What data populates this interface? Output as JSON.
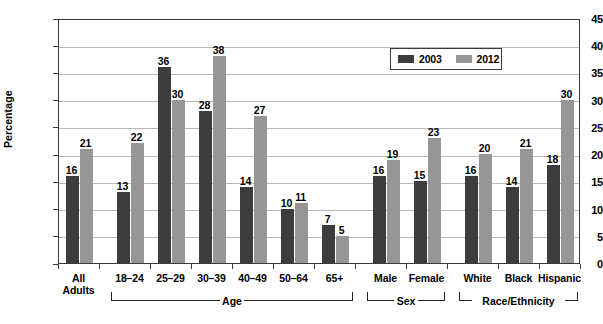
{
  "chart_data": {
    "type": "bar",
    "title": "",
    "xlabel": "",
    "ylabel": "Percentage",
    "ylim": [
      0,
      45
    ],
    "yticks": [
      0,
      5,
      10,
      15,
      20,
      25,
      30,
      35,
      40,
      45
    ],
    "grid": true,
    "legend_position": "top-right",
    "categories": [
      "All Adults",
      "18–24",
      "25–29",
      "30–39",
      "40–49",
      "50–64",
      "65+",
      "Male",
      "Female",
      "White",
      "Black",
      "Hispanic"
    ],
    "series": [
      {
        "name": "2003",
        "color": "#3c3c3c",
        "values": [
          16,
          13,
          36,
          28,
          14,
          10,
          7,
          16,
          15,
          16,
          14,
          18
        ]
      },
      {
        "name": "2012",
        "color": "#969696",
        "values": [
          21,
          22,
          30,
          38,
          27,
          11,
          5,
          19,
          23,
          20,
          21,
          30
        ]
      }
    ],
    "groups": [
      {
        "label": "Age",
        "categories": [
          "18–24",
          "25–29",
          "30–39",
          "40–49",
          "50–64",
          "65+"
        ]
      },
      {
        "label": "Sex",
        "categories": [
          "Male",
          "Female"
        ]
      },
      {
        "label": "Race/Ethnicity",
        "categories": [
          "White",
          "Black",
          "Hispanic"
        ]
      }
    ]
  },
  "axis": {
    "y_title": "Percentage",
    "y_labels": [
      "45",
      "40",
      "35",
      "30",
      "25",
      "20",
      "15",
      "10",
      "5",
      "0"
    ]
  },
  "legend": {
    "entries": [
      {
        "label": "2003",
        "color": "#3c3c3c"
      },
      {
        "label": "2012",
        "color": "#969696"
      }
    ]
  },
  "categories": [
    {
      "line1": "All",
      "line2": "Adults"
    },
    {
      "line1": "18–24",
      "line2": ""
    },
    {
      "line1": "25–29",
      "line2": ""
    },
    {
      "line1": "30–39",
      "line2": ""
    },
    {
      "line1": "40–49",
      "line2": ""
    },
    {
      "line1": "50–64",
      "line2": ""
    },
    {
      "line1": "65+",
      "line2": ""
    },
    {
      "line1": "Male",
      "line2": ""
    },
    {
      "line1": "Female",
      "line2": ""
    },
    {
      "line1": "White",
      "line2": ""
    },
    {
      "line1": "Black",
      "line2": ""
    },
    {
      "line1": "Hispanic",
      "line2": ""
    }
  ],
  "brackets": [
    {
      "label": "Age"
    },
    {
      "label": "Sex"
    },
    {
      "label": "Race/Ethnicity"
    }
  ],
  "bar_values": {
    "all_adults_2003": "16",
    "all_adults_2012": "21",
    "a18_24_2003": "13",
    "a18_24_2012": "22",
    "a25_29_2003": "36",
    "a25_29_2012": "30",
    "a30_39_2003": "28",
    "a30_39_2012": "38",
    "a40_49_2003": "14",
    "a40_49_2012": "27",
    "a50_64_2003": "10",
    "a50_64_2012": "11",
    "a65_2003": "7",
    "a65_2012": "5",
    "male_2003": "16",
    "male_2012": "19",
    "female_2003": "15",
    "female_2012": "23",
    "white_2003": "16",
    "white_2012": "20",
    "black_2003": "14",
    "black_2012": "21",
    "hispanic_2003": "18",
    "hispanic_2012": "30"
  }
}
